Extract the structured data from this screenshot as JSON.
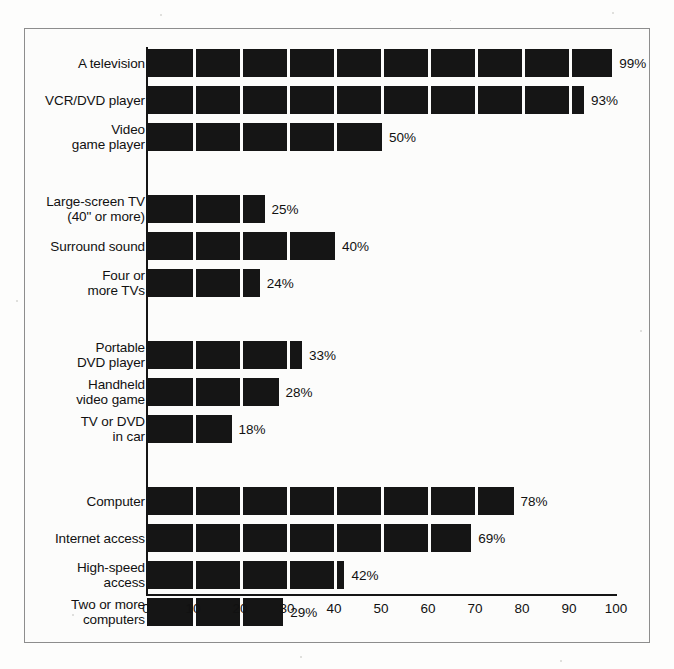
{
  "chart_data": {
    "type": "bar",
    "orientation": "horizontal",
    "title": "",
    "subtitle": "",
    "xlabel": "",
    "ylabel": "",
    "xlim": [
      0,
      100
    ],
    "xticks": [
      0,
      10,
      20,
      30,
      40,
      50,
      60,
      70,
      80,
      90,
      100
    ],
    "xtick_labels": [
      "0",
      "10",
      "20",
      "30",
      "40",
      "50",
      "60",
      "70",
      "80",
      "90",
      "100"
    ],
    "grid": true,
    "grid_style": "white separator lines across bars at every 10 units",
    "legend": null,
    "value_suffix": "%",
    "bar_color": "#151515",
    "background_color": "#fcfcfb",
    "groups": [
      {
        "name": "group-1",
        "categories": [
          "A television",
          "VCR/DVD player",
          "Video\ngame player"
        ],
        "values": [
          99,
          93,
          50
        ],
        "value_labels": [
          "99%",
          "93%",
          "50%"
        ]
      },
      {
        "name": "group-2",
        "categories": [
          "Large-screen TV\n(40\" or more)",
          "Surround sound",
          "Four or\nmore TVs"
        ],
        "values": [
          25,
          40,
          24
        ],
        "value_labels": [
          "25%",
          "40%",
          "24%"
        ]
      },
      {
        "name": "group-3",
        "categories": [
          "Portable\nDVD player",
          "Handheld\nvideo game",
          "TV or DVD\nin car"
        ],
        "values": [
          33,
          28,
          18
        ],
        "value_labels": [
          "33%",
          "28%",
          "18%"
        ]
      },
      {
        "name": "group-4",
        "categories": [
          "Computer",
          "Internet access",
          "High-speed\naccess",
          "Two or more\ncomputers"
        ],
        "values": [
          78,
          69,
          42,
          29
        ],
        "value_labels": [
          "78%",
          "69%",
          "42%",
          "29%"
        ]
      }
    ],
    "categories": [
      "A television",
      "VCR/DVD player",
      "Video\ngame player",
      "Large-screen TV\n(40\" or more)",
      "Surround sound",
      "Four or\nmore TVs",
      "Portable\nDVD player",
      "Handheld\nvideo game",
      "TV or DVD\nin car",
      "Computer",
      "Internet access",
      "High-speed\naccess",
      "Two or more\ncomputers"
    ],
    "values": [
      99,
      93,
      50,
      25,
      40,
      24,
      33,
      28,
      18,
      78,
      69,
      42,
      29
    ]
  }
}
